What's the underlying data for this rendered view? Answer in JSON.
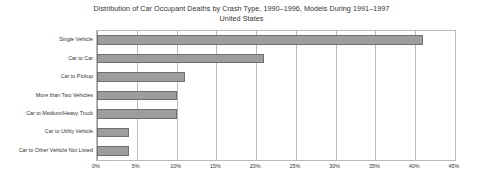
{
  "chart_data": {
    "type": "bar",
    "orientation": "horizontal",
    "title": "Distribution of Car Occupant Deaths by Crash Type, 1990–1996, Models During 1991–1997",
    "subtitle": "United States",
    "xlabel": "",
    "ylabel": "",
    "categories": [
      "Single Vehicle",
      "Car to Car",
      "Car to Pickup",
      "More than Two Vehicles",
      "Car to Medium/Heavy Truck",
      "Car to Utility Vehicle",
      "Car to Other Vehicle Not Listed"
    ],
    "values": [
      41,
      21,
      11,
      10,
      10,
      4,
      4
    ],
    "value_unit": "%",
    "xlim": [
      0,
      45
    ],
    "xticks": [
      0,
      5,
      10,
      15,
      20,
      25,
      30,
      35,
      40,
      45
    ],
    "xtick_labels": [
      "0%",
      "5%",
      "10%",
      "15%",
      "20%",
      "25%",
      "30%",
      "35%",
      "40%",
      "45%"
    ],
    "grid": "vertical",
    "legend": "none",
    "bar_color": "#9d9d9d",
    "bar_border_color": "#6f6f6f",
    "grid_color": "#b9b9b9",
    "text_color": "#333333",
    "background": "#ffffff"
  }
}
